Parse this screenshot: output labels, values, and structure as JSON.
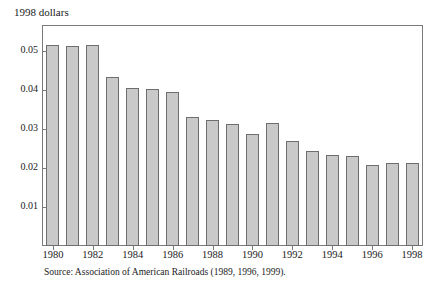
{
  "figure": {
    "axis_title": "1998 dollars",
    "source_note": "Source: Association of American Railroads (1989, 1996, 1999)."
  },
  "chart_data": {
    "type": "bar",
    "title": "",
    "subtitle": "",
    "xlabel": "",
    "ylabel": "1998 dollars",
    "ylim": [
      0,
      0.0565
    ],
    "yticks": [
      0.01,
      0.02,
      0.03,
      0.04,
      0.05
    ],
    "ytick_labels": [
      "0.01",
      "0.02",
      "0.03",
      "0.04",
      "0.05"
    ],
    "xticks": [
      1980,
      1982,
      1984,
      1986,
      1988,
      1990,
      1992,
      1994,
      1996,
      1998
    ],
    "xtick_labels": [
      "1980",
      "1982",
      "1984",
      "1986",
      "1988",
      "1990",
      "1992",
      "1994",
      "1996",
      "1998"
    ],
    "grid": false,
    "legend": false,
    "bar_color": "#c9c9c9",
    "bar_edge_color": "#6e6e6e",
    "categories": [
      "1980",
      "1981",
      "1982",
      "1983",
      "1984",
      "1985",
      "1986",
      "1987",
      "1988",
      "1989",
      "1990",
      "1991",
      "1992",
      "1993",
      "1994",
      "1995",
      "1996",
      "1997",
      "1998"
    ],
    "values": [
      0.0515,
      0.0514,
      0.0515,
      0.0434,
      0.0405,
      0.0404,
      0.0395,
      0.0331,
      0.0324,
      0.0313,
      0.0288,
      0.0317,
      0.027,
      0.0245,
      0.0235,
      0.0231,
      0.0208,
      0.0213,
      0.0213
    ]
  }
}
